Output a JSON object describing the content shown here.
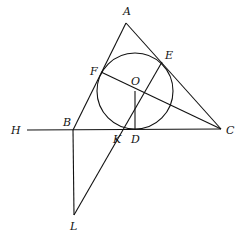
{
  "diagram": {
    "type": "geometry",
    "points": {
      "A": {
        "x": 126,
        "y": 23,
        "label": "A",
        "lx": 123,
        "ly": 15
      },
      "B": {
        "x": 73,
        "y": 130,
        "label": "B",
        "lx": 63,
        "ly": 126
      },
      "C": {
        "x": 221,
        "y": 129,
        "label": "C",
        "lx": 226,
        "ly": 134
      },
      "D": {
        "x": 135,
        "y": 130,
        "label": "D",
        "lx": 131,
        "ly": 143
      },
      "E": {
        "x": 162,
        "y": 62,
        "label": "E",
        "lx": 165,
        "ly": 59
      },
      "F": {
        "x": 101,
        "y": 72,
        "label": "F",
        "lx": 90,
        "ly": 72
      },
      "O": {
        "x": 135,
        "y": 91,
        "label": "O",
        "lx": 131,
        "ly": 84
      },
      "K": {
        "x": 117,
        "y": 130,
        "label": "K",
        "lx": 113,
        "ly": 143
      },
      "H": {
        "x": 27,
        "y": 130,
        "label": "H",
        "lx": 11,
        "ly": 134
      },
      "L": {
        "x": 74,
        "y": 215,
        "label": "L",
        "lx": 70,
        "ly": 230
      }
    },
    "circle": {
      "cx": 135,
      "cy": 91,
      "r": 38
    },
    "segments": [
      [
        "A",
        "B"
      ],
      [
        "A",
        "C"
      ],
      [
        "H",
        "C"
      ],
      [
        "F",
        "C"
      ],
      [
        "E",
        "L"
      ],
      [
        "O",
        "D"
      ],
      [
        "B",
        "L"
      ]
    ]
  }
}
